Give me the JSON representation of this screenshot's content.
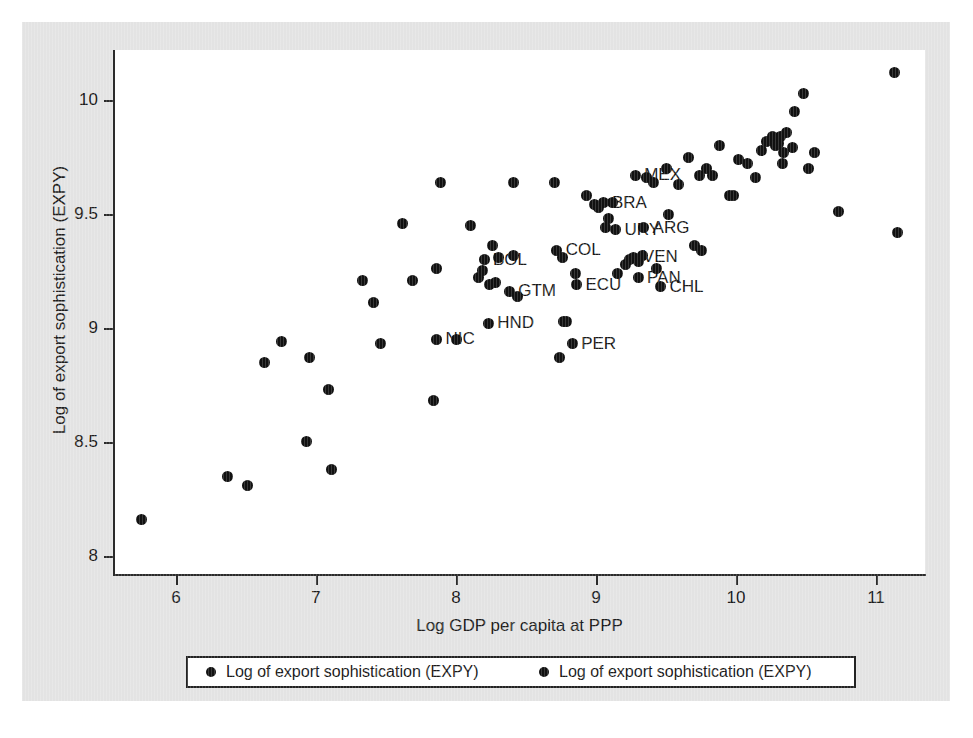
{
  "chart_data": {
    "type": "scatter",
    "title": "",
    "xlabel": "Log GDP per capita at PPP",
    "ylabel": "Log of export sophistication (EXPY)",
    "xlim": [
      5.55,
      11.35
    ],
    "ylim": [
      7.92,
      10.22
    ],
    "xticks": [
      "6",
      "7",
      "8",
      "9",
      "10",
      "11"
    ],
    "xtick_values": [
      6,
      7,
      8,
      9,
      10,
      11
    ],
    "yticks": [
      "8",
      "8.5",
      "9",
      "9.5",
      "10"
    ],
    "ytick_values": [
      8,
      8.5,
      9,
      9.5,
      10
    ],
    "grid": false,
    "legend_position": "below-axis",
    "legend": [
      {
        "label": "Log of export sophistication (EXPY)",
        "marker": "circle",
        "color": "#111111"
      },
      {
        "label": "Log of export sophistication (EXPY)",
        "marker": "circle",
        "color": "#111111"
      }
    ],
    "marker_color": "#111111",
    "series": [
      {
        "name": "Log of export sophistication (EXPY)",
        "points": [
          {
            "x": 5.75,
            "y": 8.16
          },
          {
            "x": 6.37,
            "y": 8.35
          },
          {
            "x": 6.51,
            "y": 8.31
          },
          {
            "x": 6.63,
            "y": 8.85
          },
          {
            "x": 6.75,
            "y": 8.94
          },
          {
            "x": 6.95,
            "y": 8.87
          },
          {
            "x": 6.93,
            "y": 8.5
          },
          {
            "x": 7.09,
            "y": 8.73
          },
          {
            "x": 7.11,
            "y": 8.38
          },
          {
            "x": 7.33,
            "y": 9.21
          },
          {
            "x": 7.41,
            "y": 9.11
          },
          {
            "x": 7.46,
            "y": 8.93
          },
          {
            "x": 7.62,
            "y": 9.46
          },
          {
            "x": 7.69,
            "y": 9.21
          },
          {
            "x": 7.84,
            "y": 8.68
          },
          {
            "x": 7.86,
            "y": 9.26
          },
          {
            "x": 7.89,
            "y": 9.64
          },
          {
            "x": 7.86,
            "y": 8.95,
            "label": "NIC"
          },
          {
            "x": 8.0,
            "y": 8.95
          },
          {
            "x": 8.1,
            "y": 9.45
          },
          {
            "x": 8.16,
            "y": 9.22
          },
          {
            "x": 8.19,
            "y": 9.25
          },
          {
            "x": 8.2,
            "y": 9.3,
            "label": "BOL"
          },
          {
            "x": 8.24,
            "y": 9.19
          },
          {
            "x": 8.26,
            "y": 9.36
          },
          {
            "x": 8.28,
            "y": 9.2
          },
          {
            "x": 8.3,
            "y": 9.31
          },
          {
            "x": 8.23,
            "y": 9.02,
            "label": "HND"
          },
          {
            "x": 8.38,
            "y": 9.16,
            "label": "GTM"
          },
          {
            "x": 8.41,
            "y": 9.64
          },
          {
            "x": 8.41,
            "y": 9.32
          },
          {
            "x": 8.44,
            "y": 9.14
          },
          {
            "x": 8.7,
            "y": 9.64
          },
          {
            "x": 8.72,
            "y": 9.34,
            "label": "COL"
          },
          {
            "x": 8.76,
            "y": 9.31
          },
          {
            "x": 8.74,
            "y": 8.87
          },
          {
            "x": 8.77,
            "y": 9.03
          },
          {
            "x": 8.79,
            "y": 9.03
          },
          {
            "x": 8.83,
            "y": 8.93,
            "label": "PER"
          },
          {
            "x": 8.85,
            "y": 9.24
          },
          {
            "x": 8.86,
            "y": 9.19,
            "label": "ECU"
          },
          {
            "x": 8.93,
            "y": 9.58
          },
          {
            "x": 8.99,
            "y": 9.54
          },
          {
            "x": 9.02,
            "y": 9.53
          },
          {
            "x": 9.05,
            "y": 9.55,
            "label": "BRA"
          },
          {
            "x": 9.09,
            "y": 9.48
          },
          {
            "x": 9.07,
            "y": 9.44
          },
          {
            "x": 9.12,
            "y": 9.55
          },
          {
            "x": 9.14,
            "y": 9.43,
            "label": "URY"
          },
          {
            "x": 9.15,
            "y": 9.24
          },
          {
            "x": 9.21,
            "y": 9.28
          },
          {
            "x": 9.24,
            "y": 9.3
          },
          {
            "x": 9.27,
            "y": 9.31,
            "label": "VEN"
          },
          {
            "x": 9.3,
            "y": 9.29
          },
          {
            "x": 9.33,
            "y": 9.32
          },
          {
            "x": 9.3,
            "y": 9.22,
            "label": "PAN"
          },
          {
            "x": 9.28,
            "y": 9.67,
            "label": "MEX"
          },
          {
            "x": 9.34,
            "y": 9.44,
            "label": "ARG"
          },
          {
            "x": 9.36,
            "y": 9.66
          },
          {
            "x": 9.41,
            "y": 9.64
          },
          {
            "x": 9.43,
            "y": 9.26
          },
          {
            "x": 9.46,
            "y": 9.18,
            "label": "CHL"
          },
          {
            "x": 9.5,
            "y": 9.7
          },
          {
            "x": 9.52,
            "y": 9.5
          },
          {
            "x": 9.59,
            "y": 9.63
          },
          {
            "x": 9.66,
            "y": 9.75
          },
          {
            "x": 9.7,
            "y": 9.36
          },
          {
            "x": 9.74,
            "y": 9.67
          },
          {
            "x": 9.75,
            "y": 9.34
          },
          {
            "x": 9.79,
            "y": 9.7
          },
          {
            "x": 9.83,
            "y": 9.67
          },
          {
            "x": 9.88,
            "y": 9.8
          },
          {
            "x": 9.95,
            "y": 9.58
          },
          {
            "x": 9.98,
            "y": 9.58
          },
          {
            "x": 10.02,
            "y": 9.74
          },
          {
            "x": 10.08,
            "y": 9.72
          },
          {
            "x": 10.14,
            "y": 9.66
          },
          {
            "x": 10.18,
            "y": 9.78
          },
          {
            "x": 10.22,
            "y": 9.82
          },
          {
            "x": 10.26,
            "y": 9.84
          },
          {
            "x": 10.28,
            "y": 9.8
          },
          {
            "x": 10.3,
            "y": 9.81
          },
          {
            "x": 10.32,
            "y": 9.84
          },
          {
            "x": 10.34,
            "y": 9.77
          },
          {
            "x": 10.33,
            "y": 9.72
          },
          {
            "x": 10.36,
            "y": 9.86
          },
          {
            "x": 10.4,
            "y": 9.79
          },
          {
            "x": 10.42,
            "y": 9.95
          },
          {
            "x": 10.48,
            "y": 10.03
          },
          {
            "x": 10.52,
            "y": 9.7
          },
          {
            "x": 10.56,
            "y": 9.77
          },
          {
            "x": 10.73,
            "y": 9.51
          },
          {
            "x": 11.13,
            "y": 10.12
          },
          {
            "x": 11.15,
            "y": 9.42
          }
        ]
      }
    ]
  }
}
